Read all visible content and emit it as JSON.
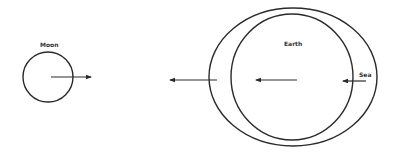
{
  "diagram": {
    "labels": {
      "moon": "Moon",
      "earth": "Earth",
      "sea": "Sea"
    },
    "elements": {
      "moon_circle": {
        "cx": 48,
        "cy": 77,
        "r": 25
      },
      "moon_arrow": {
        "x1": 51,
        "y1": 77,
        "x2": 91,
        "y2": 77,
        "direction": "right"
      },
      "earth_circle": {
        "cx": 292,
        "cy": 77,
        "rx": 61,
        "ry": 63
      },
      "water_ellipse": {
        "cx": 293,
        "cy": 77,
        "rx": 84,
        "ry": 69
      },
      "far_side_arrow": {
        "x1": 217,
        "y1": 80,
        "x2": 170,
        "y2": 80,
        "direction": "left"
      },
      "earth_arrow": {
        "x1": 297,
        "y1": 80,
        "x2": 256,
        "y2": 80,
        "direction": "left"
      },
      "sea_arrow": {
        "x1": 366,
        "y1": 81,
        "x2": 343,
        "y2": 81,
        "direction": "left"
      }
    },
    "colors": {
      "stroke": "#2a2a2a",
      "text": "#333333",
      "background": "#ffffff"
    }
  }
}
